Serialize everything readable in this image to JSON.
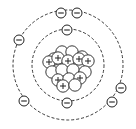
{
  "diagram": {
    "type": "bohr-atom-model",
    "element_hint": "oxygen",
    "colors": {
      "stroke": "#222222",
      "background": "#ffffff"
    },
    "center": {
      "x": 68,
      "y": 65
    },
    "shells": [
      {
        "name": "inner-shell",
        "radius": 36,
        "electrons": [
          {
            "x": 67,
            "y": 30
          },
          {
            "x": 67,
            "y": 103
          }
        ]
      },
      {
        "name": "outer-shell",
        "radius": 55,
        "electrons": [
          {
            "x": 61,
            "y": 13
          },
          {
            "x": 77,
            "y": 13
          },
          {
            "x": 19,
            "y": 40
          },
          {
            "x": 24,
            "y": 101
          },
          {
            "x": 121,
            "y": 88
          },
          {
            "x": 112,
            "y": 102
          }
        ]
      }
    ],
    "electron_symbol": "−",
    "proton_symbol": "+",
    "nucleus": {
      "particles": [
        {
          "x": 54,
          "y": 59,
          "proton": false
        },
        {
          "x": 62,
          "y": 52,
          "proton": false
        },
        {
          "x": 72,
          "y": 52,
          "proton": false
        },
        {
          "x": 82,
          "y": 57,
          "proton": false
        },
        {
          "x": 49,
          "y": 62,
          "proton": true
        },
        {
          "x": 58,
          "y": 58,
          "proton": true
        },
        {
          "x": 68,
          "y": 61,
          "proton": true
        },
        {
          "x": 79,
          "y": 59,
          "proton": true
        },
        {
          "x": 88,
          "y": 61,
          "proton": true
        },
        {
          "x": 52,
          "y": 72,
          "proton": false
        },
        {
          "x": 62,
          "y": 70,
          "proton": false
        },
        {
          "x": 73,
          "y": 70,
          "proton": false
        },
        {
          "x": 85,
          "y": 72,
          "proton": false
        },
        {
          "x": 58,
          "y": 80,
          "proton": true
        },
        {
          "x": 69,
          "y": 79,
          "proton": false
        },
        {
          "x": 80,
          "y": 78,
          "proton": true
        },
        {
          "x": 63,
          "y": 86,
          "proton": true
        },
        {
          "x": 75,
          "y": 85,
          "proton": false
        }
      ]
    }
  }
}
